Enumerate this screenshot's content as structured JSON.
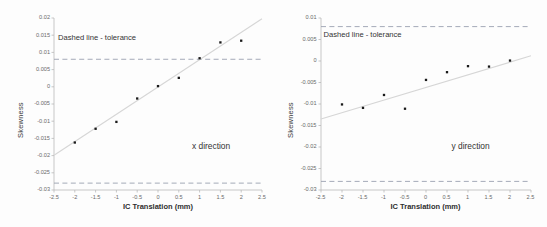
{
  "figure": {
    "background": "#fdfdfd",
    "point_color": "#1a1a1a",
    "trend_color": "#d6d6d6",
    "tolerance_color": "#9aa0b0",
    "axis_color": "#b9b9b9"
  },
  "chart_data": [
    {
      "type": "scatter",
      "title": "",
      "panel_label": "x direction",
      "annotation": "Dashed line - tolerance",
      "xlabel": "IC Translation (mm)",
      "ylabel": "Skewness",
      "xlim": [
        -2.5,
        2.5
      ],
      "ylim": [
        -0.03,
        0.02
      ],
      "xticks": [
        -2.5,
        -2,
        -1.5,
        -1,
        -0.5,
        0,
        0.5,
        1,
        1.5,
        2,
        2.5
      ],
      "xticklabels": [
        "-2.5",
        "-2",
        "-1.5",
        "-1",
        "-0.5",
        "0",
        "0.5",
        "1",
        "1.5",
        "2",
        "2.5"
      ],
      "yticks": [
        -0.03,
        -0.025,
        -0.02,
        -0.015,
        -0.01,
        -0.005,
        0,
        0.005,
        0.01,
        0.015,
        0.02
      ],
      "yticklabels": [
        "-0.03",
        "-0.025",
        "-0.02",
        "-0.015",
        "-0.01",
        "-0.005",
        "0",
        "0.005",
        "0.01",
        "0.015",
        "0.02"
      ],
      "grid": false,
      "legend": "none",
      "x": [
        -2,
        -1.5,
        -1,
        -0.5,
        0,
        0.5,
        1,
        1.5,
        2
      ],
      "values": [
        -0.0162,
        -0.0122,
        -0.0102,
        -0.0034,
        0.0002,
        0.0026,
        0.0083,
        0.0129,
        0.0134
      ],
      "tolerance_lines": [
        0.008,
        -0.028
      ],
      "trendline": {
        "x": [
          -2.5,
          2.5
        ],
        "y": [
          -0.0199,
          0.0198
        ]
      }
    },
    {
      "type": "scatter",
      "title": "",
      "panel_label": "y direction",
      "annotation": "Dashed line - tolerance",
      "xlabel": "IC Translation (mm)",
      "ylabel": "Skewness",
      "xlim": [
        -2.5,
        2.5
      ],
      "ylim": [
        -0.03,
        0.01
      ],
      "xticks": [
        -2.5,
        -2,
        -1.5,
        -1,
        -0.5,
        0,
        0.5,
        1,
        1.5,
        2,
        2.5
      ],
      "xticklabels": [
        "-2.5",
        "-2",
        "-1.5",
        "-1",
        "-0.5",
        "0",
        "0.5",
        "1",
        "1.5",
        "2",
        "2.5"
      ],
      "yticks": [
        -0.03,
        -0.025,
        -0.02,
        -0.015,
        -0.01,
        -0.005,
        0,
        0.005,
        0.01
      ],
      "yticklabels": [
        "-0.03",
        "-0.025",
        "-0.02",
        "-0.015",
        "-0.01",
        "-0.005",
        "0",
        "0.005",
        "0.01"
      ],
      "grid": false,
      "legend": "none",
      "x": [
        -2,
        -1.5,
        -1,
        -0.5,
        0,
        0.5,
        1,
        1.5,
        2
      ],
      "values": [
        -0.0101,
        -0.0109,
        -0.0079,
        -0.0111,
        -0.0044,
        -0.0026,
        -0.0012,
        -0.0013,
        0.0001
      ],
      "tolerance_lines": [
        0.008,
        -0.028
      ],
      "trendline": {
        "x": [
          -2.5,
          2.5
        ],
        "y": [
          -0.0135,
          0.0012
        ]
      }
    }
  ]
}
